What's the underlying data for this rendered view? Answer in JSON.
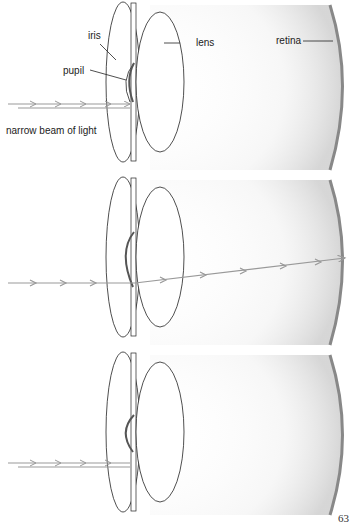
{
  "labels": {
    "iris": "iris",
    "lens": "lens",
    "retina": "retina",
    "pupil": "pupil",
    "beam": "narrow beam of light"
  },
  "page_number": "63",
  "panels": [
    {
      "id": "top",
      "pupil_position": "center",
      "beam": "enters pupil, blocked at edge"
    },
    {
      "id": "middle",
      "pupil_position": "shifted up",
      "beam": "passes through pupil to retina"
    },
    {
      "id": "bottom",
      "pupil_position": "shifted up",
      "beam": "blocked by iris"
    }
  ],
  "colors": {
    "line": "#222222",
    "beam": "#999999",
    "retina": "#888888"
  }
}
